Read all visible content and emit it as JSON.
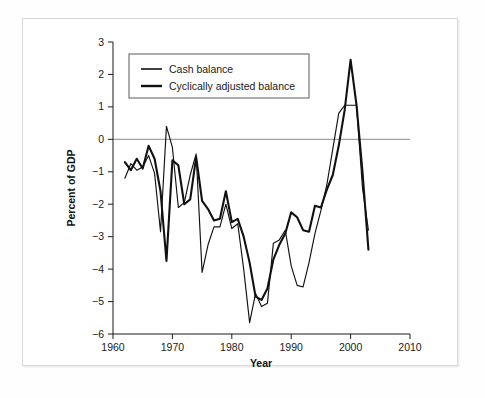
{
  "chart_data": {
    "type": "line",
    "title": "",
    "xlabel": "Year",
    "ylabel": "Percent of GDP",
    "xlim": [
      1960,
      2010
    ],
    "ylim": [
      -6,
      3
    ],
    "xticks": [
      "1960",
      "1970",
      "1980",
      "1990",
      "2000",
      "2010"
    ],
    "xtick_values": [
      1960,
      1970,
      1980,
      1990,
      2000,
      2010
    ],
    "yticks": [
      "3",
      "2",
      "1",
      "0",
      "−1",
      "−2",
      "−3",
      "−4",
      "−5",
      "−6"
    ],
    "ytick_values": [
      3,
      2,
      1,
      0,
      -1,
      -2,
      -3,
      -4,
      -5,
      -6
    ],
    "grid": false,
    "zero_line": true,
    "legend_position": "upper-left-inside",
    "x": [
      1962,
      1963,
      1964,
      1965,
      1966,
      1967,
      1968,
      1969,
      1970,
      1971,
      1972,
      1973,
      1974,
      1975,
      1976,
      1977,
      1978,
      1979,
      1980,
      1981,
      1982,
      1983,
      1984,
      1985,
      1986,
      1987,
      1988,
      1989,
      1990,
      1991,
      1992,
      1993,
      1994,
      1995,
      1996,
      1997,
      1998,
      1999,
      2000,
      2001,
      2002,
      2003
    ],
    "series": [
      {
        "name": "Cash balance",
        "line_style": "thin",
        "color": "#111111",
        "values": [
          -1.2,
          -0.75,
          -0.95,
          -0.85,
          -0.5,
          -1.05,
          -2.85,
          0.4,
          -0.25,
          -2.1,
          -1.95,
          -1.1,
          -0.45,
          -4.1,
          -3.25,
          -2.7,
          -2.7,
          -2.0,
          -2.75,
          -2.6,
          -4.0,
          -5.65,
          -4.75,
          -5.15,
          -5.05,
          -3.2,
          -3.1,
          -2.8,
          -3.9,
          -4.5,
          -4.55,
          -3.8,
          -2.9,
          -2.2,
          -1.4,
          -0.3,
          0.8,
          1.05,
          1.05,
          1.05,
          -1.5,
          -2.8
        ]
      },
      {
        "name": "Cyclically adjusted balance",
        "line_style": "thick",
        "color": "#111111",
        "values": [
          -0.7,
          -0.95,
          -0.6,
          -0.9,
          -0.2,
          -0.6,
          -1.6,
          -3.75,
          -0.65,
          -0.8,
          -2.0,
          -1.85,
          -0.55,
          -1.9,
          -2.15,
          -2.5,
          -2.45,
          -1.6,
          -2.55,
          -2.45,
          -3.0,
          -3.8,
          -4.85,
          -4.95,
          -4.6,
          -3.7,
          -3.25,
          -2.9,
          -2.25,
          -2.4,
          -2.8,
          -2.85,
          -2.05,
          -2.1,
          -1.55,
          -1.1,
          -0.2,
          0.9,
          2.45,
          1.05,
          -1.0,
          -3.4
        ]
      }
    ]
  },
  "axes": {
    "x_title": "Year",
    "y_title": "Percent of GDP"
  },
  "legend": {
    "entries": [
      {
        "label": "Cash balance",
        "swatch": "thin-line-swatch"
      },
      {
        "label": "Cyclically adjusted balance",
        "swatch": "thick-line-swatch"
      }
    ]
  },
  "colors": {
    "series": "#111111",
    "axis": "#1a1a1a",
    "zero_line": "#8a8a8a",
    "frame_border": "#d9d9d9",
    "page_background": "#fefefe",
    "plot_background": "#ffffff"
  }
}
